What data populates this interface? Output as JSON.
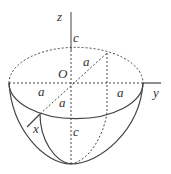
{
  "diagram": {
    "type": "half-ellipsoid",
    "labels": {
      "z_axis": "z",
      "y_axis": "y",
      "x_axis": "x",
      "origin": "O",
      "c_top": "c",
      "c_bottom": "c",
      "a_left": "a",
      "a_right": "a",
      "a_upper_diag": "a",
      "a_lower_diag": "a"
    },
    "colors": {
      "stroke": "#444444",
      "text": "#333333",
      "background": "#ffffff"
    }
  }
}
